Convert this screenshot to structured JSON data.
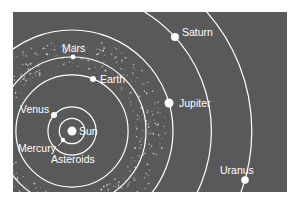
{
  "diagram": {
    "background_color": "#595959",
    "page_color": "#ffffff",
    "line_color": "#ffffff",
    "sun": {
      "label": "Sun",
      "cx": 72,
      "cy": 131
    },
    "planets": [
      {
        "name": "Mercury",
        "label": "Mercury",
        "orbit_r": 12,
        "x": 63,
        "y": 140,
        "label_x": 18,
        "label_y": 152
      },
      {
        "name": "Venus",
        "label": "Venus",
        "orbit_r": 24,
        "x": 54,
        "y": 115,
        "label_x": 20,
        "label_y": 113
      },
      {
        "name": "Earth",
        "label": "Earth",
        "orbit_r": 34,
        "x": 93,
        "y": 79,
        "label_x": 100,
        "label_y": 83
      },
      {
        "name": "Mars",
        "label": "Mars",
        "orbit_r": 50,
        "x": 73,
        "y": 57,
        "label_x": 62,
        "label_y": 52
      },
      {
        "name": "Jupiter",
        "label": "Jupiter",
        "orbit_r": 100,
        "x": 169,
        "y": 103,
        "label_x": 179,
        "label_y": 107
      },
      {
        "name": "Saturn",
        "label": "Saturn",
        "orbit_r": 140,
        "x": 175,
        "y": 37,
        "label_x": 182,
        "label_y": 36
      },
      {
        "name": "Uranus",
        "label": "Uranus",
        "orbit_r": 210,
        "x": 245,
        "y": 180,
        "label_x": 220,
        "label_y": 174
      }
    ],
    "asteroids": {
      "label": "Asteroids",
      "label_x": 51,
      "label_y": 163
    }
  }
}
